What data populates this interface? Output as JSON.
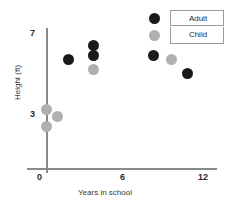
{
  "chart_data": {
    "type": "scatter",
    "title": "",
    "xlabel": "Years in school",
    "ylabel": "Height (ft)",
    "xlim": [
      0,
      12
    ],
    "ylim": [
      1.5,
      7
    ],
    "xticks": [
      "0",
      "6",
      "12"
    ],
    "yticks": [
      "3",
      "7"
    ],
    "grid": false,
    "legend_position": "top-right",
    "series": [
      {
        "name": "Adult",
        "color": "#1a1a1a",
        "points": [
          {
            "x": 1.7,
            "y": 5.7
          },
          {
            "x": 3.6,
            "y": 6.4
          },
          {
            "x": 3.6,
            "y": 5.9
          },
          {
            "x": 8.2,
            "y": 5.9
          },
          {
            "x": 10.8,
            "y": 5.0
          }
        ]
      },
      {
        "name": "Child",
        "color": "#b0b0b0",
        "points": [
          {
            "x": 0.0,
            "y": 3.2
          },
          {
            "x": 0.0,
            "y": 2.4
          },
          {
            "x": 0.9,
            "y": 2.9
          },
          {
            "x": 3.6,
            "y": 5.2
          },
          {
            "x": 9.6,
            "y": 5.7
          }
        ]
      }
    ]
  },
  "axes": {
    "x_title": "Years in school",
    "y_title": "Height (ft)",
    "x_ticks": {
      "t0": "0",
      "t1": "6",
      "t2": "12"
    },
    "y_ticks": {
      "t0": "3",
      "t1": "7"
    }
  },
  "legend": {
    "entries": [
      {
        "label": "Adult",
        "color": "#1a1a1a"
      },
      {
        "label": "Child",
        "color": "#b0b0b0"
      }
    ]
  },
  "colors": {
    "adult": "#1a1a1a",
    "child": "#b0b0b0",
    "axis": "#8a8a8a",
    "text": "#2b2b2b",
    "background": "#ffffff"
  }
}
